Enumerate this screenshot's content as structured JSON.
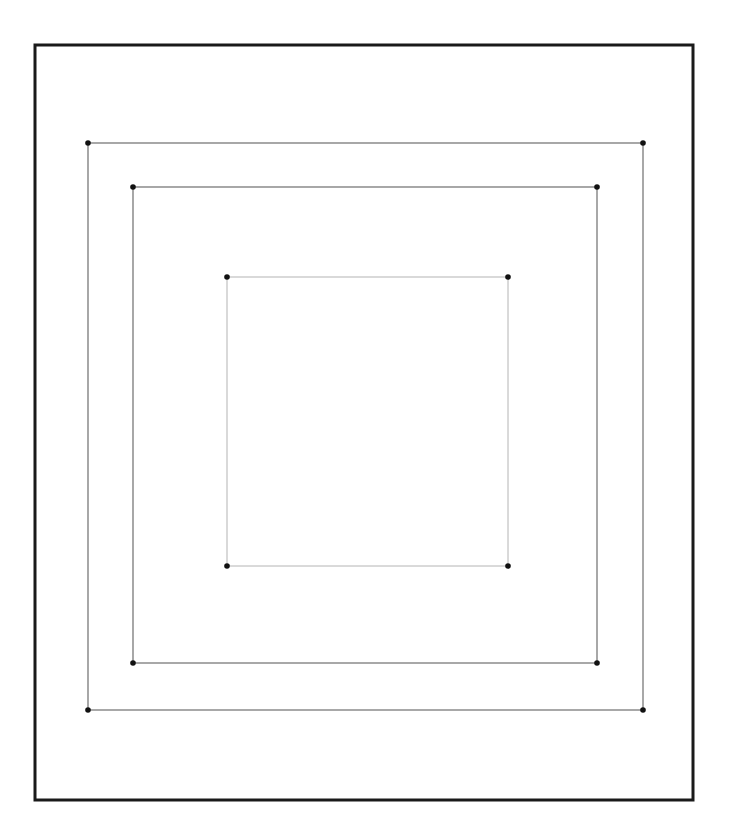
{
  "canvas": {
    "width": 735,
    "height": 834,
    "background": "#ffffff"
  },
  "frame": {
    "x1": 35,
    "y1": 45,
    "x2": 693,
    "y2": 800,
    "stroke": "#1a1a1a",
    "stroke_width": 3
  },
  "squares": [
    {
      "name": "outer-square",
      "x1": 88,
      "y1": 143,
      "x2": 643,
      "y2": 710,
      "stroke": "#6e6e6e",
      "stroke_width": 1.2
    },
    {
      "name": "middle-square",
      "x1": 133,
      "y1": 187,
      "x2": 597,
      "y2": 663,
      "stroke": "#6e6e6e",
      "stroke_width": 1.2
    },
    {
      "name": "inner-square",
      "x1": 227,
      "y1": 277,
      "x2": 508,
      "y2": 566,
      "stroke": "#b4b4b4",
      "stroke_width": 1
    }
  ],
  "vertex_style": {
    "radius": 2.8,
    "fill": "#111111"
  }
}
